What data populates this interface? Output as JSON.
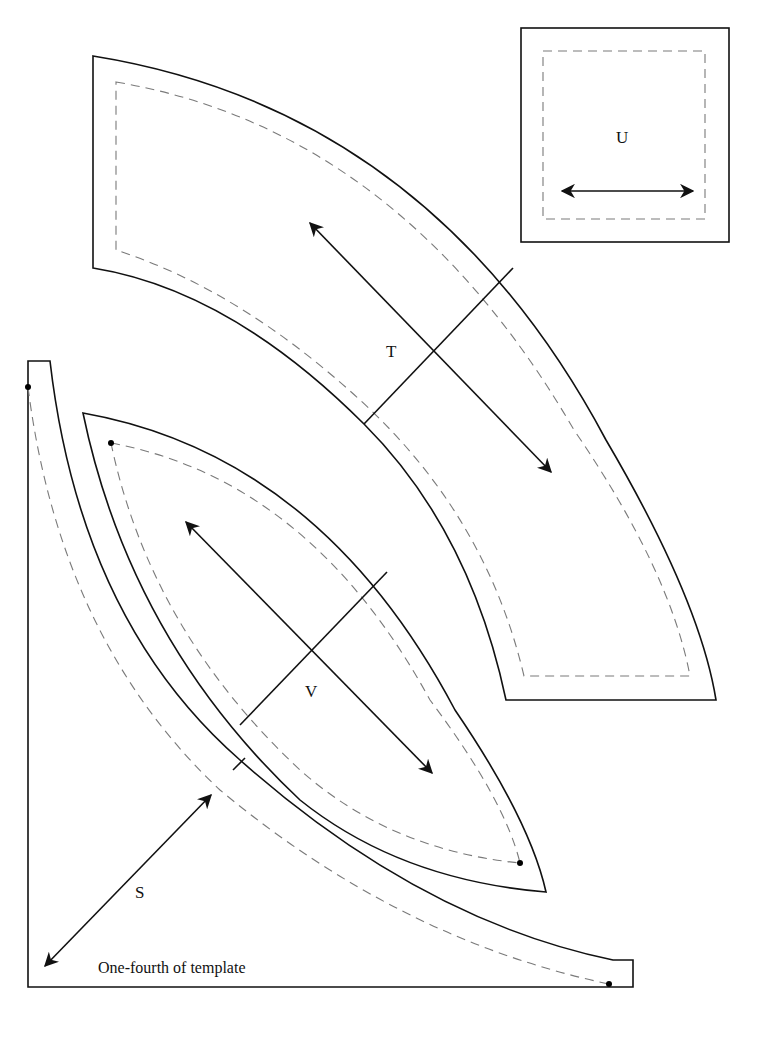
{
  "pieces": {
    "S": {
      "label": "S",
      "has_grainline": true,
      "seam_dots": 2
    },
    "T": {
      "label": "T",
      "has_grainline": true,
      "seam_dots": 0
    },
    "U": {
      "label": "U",
      "has_grainline": true,
      "seam_dots": 0
    },
    "V": {
      "label": "V",
      "has_grainline": true,
      "seam_dots": 2
    }
  },
  "note": "One-fourth of template",
  "legend": {
    "solid_line": "cutting line",
    "dashed_line": "seam line",
    "arrow": "grainline"
  }
}
